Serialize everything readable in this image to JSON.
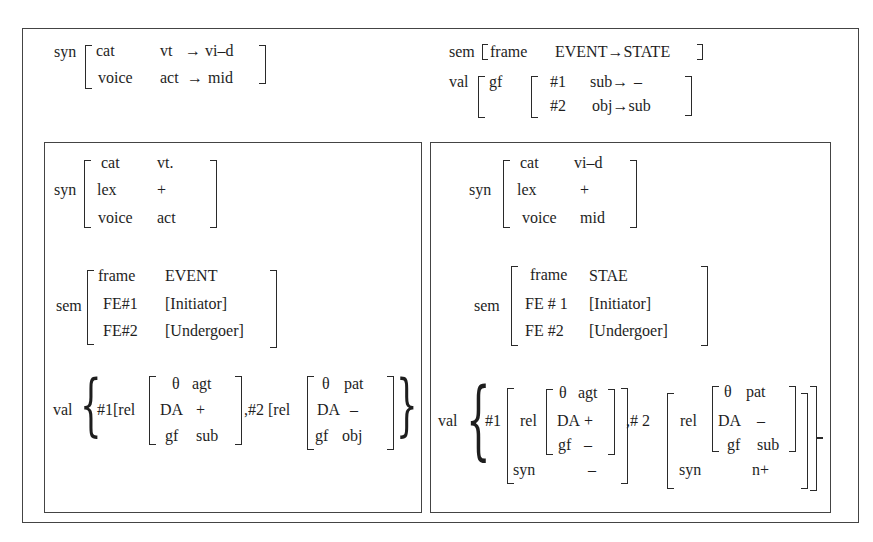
{
  "diagram": {
    "type": "attribute-value matrix (feature structure)",
    "top": {
      "syn": {
        "label": "syn",
        "rows": [
          {
            "attr": "cat",
            "value": "vt",
            "arrow": "→",
            "result": "vi–d"
          },
          {
            "attr": "voice",
            "value": "act",
            "arrow": "→",
            "result": "mid"
          }
        ]
      },
      "sem": {
        "label": "sem",
        "open": "[",
        "attr": "frame",
        "value": "EVENT→STATE",
        "close": "]"
      },
      "val": {
        "label": "val",
        "attr": "gf",
        "rows": [
          {
            "arg": "#1",
            "value": "sub→",
            "result": "–"
          },
          {
            "arg": "#2",
            "value": "obj→sub",
            "result": ""
          }
        ]
      }
    },
    "left": {
      "syn": {
        "label": "syn",
        "rows": [
          {
            "attr": "cat",
            "value": "vt."
          },
          {
            "attr": "lex",
            "value": "+"
          },
          {
            "attr": "voice",
            "value": "act"
          }
        ]
      },
      "sem": {
        "label": "sem",
        "rows": [
          {
            "attr": "frame",
            "value": "EVENT"
          },
          {
            "attr": "FE#1",
            "value": "[Initiator]"
          },
          {
            "attr": "FE#2",
            "value": "[Undergoer]"
          }
        ]
      },
      "val": {
        "label": "val",
        "arg1": {
          "prefix": "#1[rel",
          "rows": [
            {
              "attr": "θ",
              "value": "agt"
            },
            {
              "attr": "DA",
              "value": "+"
            },
            {
              "attr": "gf",
              "value": "sub"
            }
          ]
        },
        "arg2": {
          "prefix": ",#2 [rel",
          "rows": [
            {
              "attr": "θ",
              "value": "pat"
            },
            {
              "attr": "DA",
              "value": "–"
            },
            {
              "attr": "gf",
              "value": "obj"
            }
          ]
        }
      }
    },
    "right": {
      "syn": {
        "label": "syn",
        "rows": [
          {
            "attr": "cat",
            "value": "vi–d"
          },
          {
            "attr": "lex",
            "value": "+"
          },
          {
            "attr": "voice",
            "value": "mid"
          }
        ]
      },
      "sem": {
        "label": "sem",
        "rows": [
          {
            "attr": "frame",
            "value": "STAE"
          },
          {
            "attr": "FE # 1",
            "value": "[Initiator]"
          },
          {
            "attr": "FE #2",
            "value": "[Undergoer]"
          }
        ]
      },
      "val": {
        "label": "val",
        "arg1": {
          "id": "#1",
          "rel_label": "rel",
          "rel_rows": [
            {
              "attr": "θ",
              "value": "agt"
            },
            {
              "attr": "DA",
              "value": "+"
            },
            {
              "attr": "gf",
              "value": "–"
            }
          ],
          "syn_label": "syn",
          "syn_value": "–"
        },
        "arg2": {
          "id": ",# 2",
          "rel_label": "rel",
          "rel_rows": [
            {
              "attr": "θ",
              "value": "pat"
            },
            {
              "attr": "DA",
              "value": "–"
            },
            {
              "attr": "gf",
              "value": "sub"
            }
          ],
          "syn_label": "syn",
          "syn_value": "n+"
        }
      }
    }
  }
}
